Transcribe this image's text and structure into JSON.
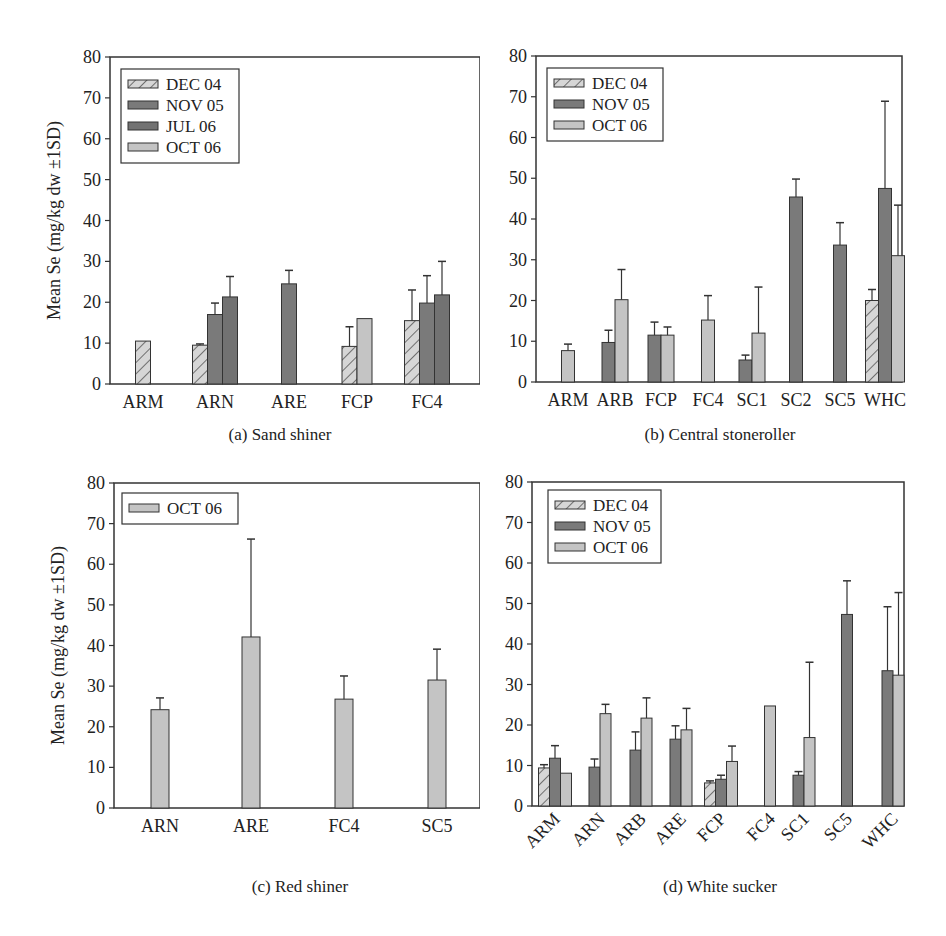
{
  "figure": {
    "ylabel": "Mean Se (mg/kg dw ±1SD)",
    "series_styles": {
      "DEC 04": {
        "fill": "#d4d4d4",
        "pattern": "hatch"
      },
      "NOV 05": {
        "fill": "#7a7a7a",
        "pattern": "solid"
      },
      "JUL 06": {
        "fill": "#727272",
        "pattern": "solid"
      },
      "OCT 06": {
        "fill": "#c4c4c4",
        "pattern": "solid"
      }
    }
  },
  "chart_data": [
    {
      "id": "a",
      "type": "bar",
      "title": "(a) Sand shiner",
      "xlabel": "",
      "ylabel": "Mean Se (mg/kg dw ±1SD)",
      "ylim": [
        0,
        80
      ],
      "yticks": [
        0,
        10,
        20,
        30,
        40,
        50,
        60,
        70,
        80
      ],
      "grid": false,
      "legend_position": "upper-left",
      "categories": [
        "ARM",
        "ARN",
        "ARE",
        "FCP",
        "FC4"
      ],
      "series": [
        {
          "name": "DEC 04",
          "values": [
            10.5,
            9.5,
            null,
            9.2,
            15.5
          ],
          "sd_upper": [
            null,
            9.8,
            null,
            14.0,
            23.0
          ]
        },
        {
          "name": "NOV 05",
          "values": [
            null,
            17.0,
            24.5,
            null,
            19.8
          ],
          "sd_upper": [
            null,
            19.8,
            27.8,
            null,
            26.5
          ]
        },
        {
          "name": "JUL 06",
          "values": [
            null,
            21.3,
            null,
            null,
            21.8
          ],
          "sd_upper": [
            null,
            26.3,
            null,
            null,
            30.0
          ]
        },
        {
          "name": "OCT 06",
          "values": [
            null,
            null,
            null,
            16.0,
            null
          ],
          "sd_upper": [
            null,
            null,
            null,
            null,
            null
          ]
        }
      ]
    },
    {
      "id": "b",
      "type": "bar",
      "title": "(b) Central stoneroller",
      "xlabel": "",
      "ylabel": "",
      "ylim": [
        0,
        80
      ],
      "yticks": [
        0,
        10,
        20,
        30,
        40,
        50,
        60,
        70,
        80
      ],
      "grid": false,
      "legend_position": "upper-left",
      "categories": [
        "ARM",
        "ARB",
        "FCP",
        "FC4",
        "SC1",
        "SC2",
        "SC5",
        "WHC"
      ],
      "series": [
        {
          "name": "DEC 04",
          "values": [
            null,
            null,
            null,
            null,
            null,
            null,
            null,
            20.0
          ],
          "sd_upper": [
            null,
            null,
            null,
            null,
            null,
            null,
            null,
            22.7
          ]
        },
        {
          "name": "NOV 05",
          "values": [
            null,
            9.7,
            11.5,
            null,
            5.4,
            45.4,
            33.6,
            47.5
          ],
          "sd_upper": [
            null,
            12.7,
            14.7,
            null,
            6.6,
            49.8,
            39.1,
            68.9
          ]
        },
        {
          "name": "OCT 06",
          "values": [
            7.7,
            20.2,
            11.5,
            15.2,
            12.0,
            null,
            null,
            31.0
          ],
          "sd_upper": [
            9.3,
            27.6,
            13.5,
            21.2,
            23.3,
            null,
            null,
            43.4
          ]
        }
      ]
    },
    {
      "id": "c",
      "type": "bar",
      "title": "(c) Red shiner",
      "xlabel": "",
      "ylabel": "Mean Se (mg/kg dw ±1SD)",
      "ylim": [
        0,
        80
      ],
      "yticks": [
        0,
        10,
        20,
        30,
        40,
        50,
        60,
        70,
        80
      ],
      "grid": false,
      "legend_position": "upper-left",
      "categories": [
        "ARN",
        "ARE",
        "FC4",
        "SC5"
      ],
      "series": [
        {
          "name": "OCT 06",
          "values": [
            24.2,
            42.1,
            26.8,
            31.5
          ],
          "sd_upper": [
            27.1,
            66.2,
            32.5,
            39.1
          ]
        }
      ]
    },
    {
      "id": "d",
      "type": "bar",
      "title": "(d) White sucker",
      "xlabel": "",
      "ylabel": "",
      "ylim": [
        0,
        80
      ],
      "yticks": [
        0,
        10,
        20,
        30,
        40,
        50,
        60,
        70,
        80
      ],
      "grid": false,
      "legend_position": "upper-left",
      "xtick_rotation": -45,
      "categories": [
        "ARM",
        "ARN",
        "ARB",
        "ARE",
        "FCP",
        "FC4",
        "SC1",
        "SC5",
        "WHC"
      ],
      "series": [
        {
          "name": "DEC 04",
          "values": [
            9.4,
            null,
            null,
            null,
            5.7,
            null,
            null,
            null,
            null
          ],
          "sd_upper": [
            10.2,
            null,
            null,
            null,
            6.2,
            null,
            null,
            null,
            null
          ]
        },
        {
          "name": "NOV 05",
          "values": [
            11.8,
            9.6,
            13.8,
            16.5,
            6.6,
            null,
            7.6,
            47.3,
            33.4
          ],
          "sd_upper": [
            14.9,
            11.6,
            18.3,
            19.8,
            7.6,
            null,
            8.5,
            55.6,
            49.2
          ]
        },
        {
          "name": "OCT 06",
          "values": [
            8.1,
            22.8,
            21.7,
            18.8,
            11.0,
            24.7,
            16.9,
            null,
            32.3
          ],
          "sd_upper": [
            null,
            25.1,
            26.7,
            24.1,
            14.8,
            null,
            35.5,
            null,
            52.7
          ]
        }
      ]
    }
  ]
}
